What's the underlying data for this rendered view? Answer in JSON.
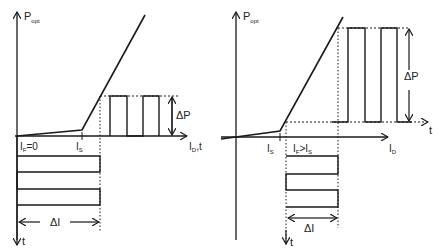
{
  "left_diagram": {
    "y_axis_label": "P",
    "y_axis_sub": "opt",
    "x_axis_label": "I",
    "x_axis_sub": "D",
    "x_axis_suffix": ",t",
    "origin_label": "I",
    "origin_sub": "F",
    "origin_value": "=0",
    "threshold_label": "I",
    "threshold_sub": "S",
    "delta_p_label": "ΔP",
    "delta_i_label": "ΔI",
    "time_axis_label": "t"
  },
  "right_diagram": {
    "y_axis_label": "P",
    "y_axis_sub": "opt",
    "x_axis_label": "I",
    "x_axis_sub": "D",
    "time_axis_right_label": "t",
    "threshold_label": "I",
    "threshold_sub": "S",
    "bias_label_main": "I",
    "bias_label_sub": "F",
    "bias_relation": ">I",
    "bias_relation_sub": "S",
    "delta_p_label": "ΔP",
    "delta_i_label": "ΔI",
    "time_axis_label": "t"
  },
  "colors": {
    "line": "#1a1a1a",
    "background": "#ffffff"
  }
}
